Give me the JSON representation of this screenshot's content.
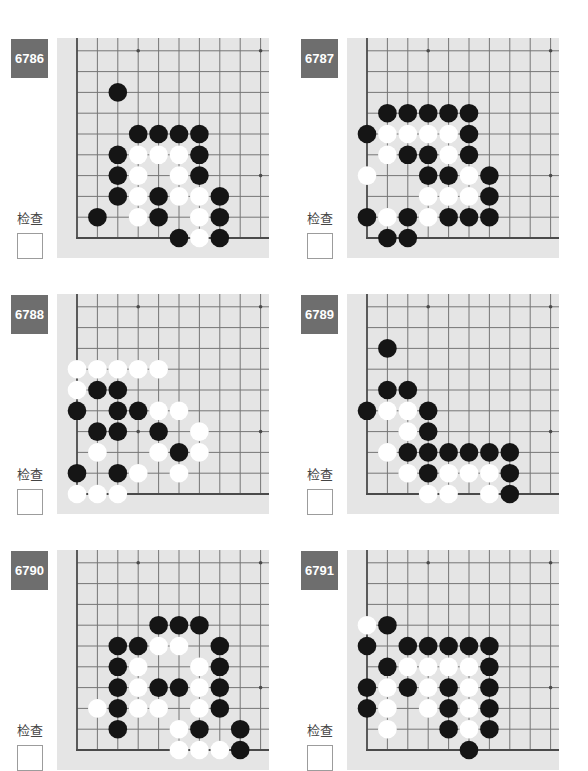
{
  "colors": {
    "page_background": "#ffffff",
    "badge_background": "#6e6e6e",
    "badge_text": "#ffffff",
    "label_text": "#444444",
    "checkbox_border": "#9c9c9c",
    "board_background": "#e5e5e5",
    "grid_line": "#767676",
    "board_edge": "#4a4a4a",
    "star_point": "#4a4a4a",
    "black_stone": "#151515",
    "white_stone": "#ffffff"
  },
  "board": {
    "visible_columns": 10,
    "visible_rows": 10,
    "visible_edges": [
      "left",
      "bottom"
    ],
    "star_points": [
      [
        3,
        3
      ],
      [
        3,
        9
      ],
      [
        9,
        3
      ],
      [
        9,
        9
      ]
    ]
  },
  "problems": [
    {
      "number": "6786",
      "check_label": "检查",
      "checked": false,
      "black": [
        [
          2,
          7
        ],
        [
          3,
          5
        ],
        [
          4,
          5
        ],
        [
          5,
          5
        ],
        [
          6,
          5
        ],
        [
          2,
          4
        ],
        [
          6,
          4
        ],
        [
          2,
          3
        ],
        [
          6,
          3
        ],
        [
          2,
          2
        ],
        [
          4,
          2
        ],
        [
          7,
          2
        ],
        [
          1,
          1
        ],
        [
          4,
          1
        ],
        [
          7,
          1
        ],
        [
          5,
          0
        ],
        [
          7,
          0
        ]
      ],
      "white": [
        [
          3,
          4
        ],
        [
          4,
          4
        ],
        [
          5,
          4
        ],
        [
          3,
          3
        ],
        [
          5,
          3
        ],
        [
          3,
          2
        ],
        [
          5,
          2
        ],
        [
          6,
          2
        ],
        [
          3,
          1
        ],
        [
          6,
          1
        ],
        [
          6,
          0
        ]
      ]
    },
    {
      "number": "6787",
      "check_label": "检查",
      "checked": false,
      "black": [
        [
          1,
          6
        ],
        [
          2,
          6
        ],
        [
          3,
          6
        ],
        [
          4,
          6
        ],
        [
          5,
          6
        ],
        [
          0,
          5
        ],
        [
          5,
          5
        ],
        [
          2,
          4
        ],
        [
          3,
          4
        ],
        [
          5,
          4
        ],
        [
          3,
          3
        ],
        [
          4,
          3
        ],
        [
          6,
          3
        ],
        [
          6,
          2
        ],
        [
          0,
          1
        ],
        [
          2,
          1
        ],
        [
          4,
          1
        ],
        [
          5,
          1
        ],
        [
          6,
          1
        ],
        [
          1,
          0
        ],
        [
          2,
          0
        ]
      ],
      "white": [
        [
          1,
          5
        ],
        [
          2,
          5
        ],
        [
          3,
          5
        ],
        [
          4,
          5
        ],
        [
          1,
          4
        ],
        [
          4,
          4
        ],
        [
          0,
          3
        ],
        [
          5,
          3
        ],
        [
          3,
          2
        ],
        [
          4,
          2
        ],
        [
          5,
          2
        ],
        [
          1,
          1
        ],
        [
          3,
          1
        ]
      ]
    },
    {
      "number": "6788",
      "check_label": "检查",
      "checked": false,
      "black": [
        [
          1,
          5
        ],
        [
          2,
          5
        ],
        [
          0,
          4
        ],
        [
          2,
          4
        ],
        [
          3,
          4
        ],
        [
          1,
          3
        ],
        [
          2,
          3
        ],
        [
          4,
          3
        ],
        [
          5,
          2
        ],
        [
          0,
          1
        ],
        [
          2,
          1
        ]
      ],
      "white": [
        [
          0,
          6
        ],
        [
          1,
          6
        ],
        [
          2,
          6
        ],
        [
          3,
          6
        ],
        [
          4,
          6
        ],
        [
          0,
          5
        ],
        [
          4,
          4
        ],
        [
          5,
          4
        ],
        [
          6,
          3
        ],
        [
          1,
          2
        ],
        [
          4,
          2
        ],
        [
          6,
          2
        ],
        [
          3,
          1
        ],
        [
          5,
          1
        ],
        [
          0,
          0
        ],
        [
          1,
          0
        ],
        [
          2,
          0
        ]
      ]
    },
    {
      "number": "6789",
      "check_label": "检查",
      "checked": false,
      "black": [
        [
          1,
          7
        ],
        [
          1,
          5
        ],
        [
          2,
          5
        ],
        [
          0,
          4
        ],
        [
          3,
          4
        ],
        [
          3,
          3
        ],
        [
          2,
          2
        ],
        [
          3,
          2
        ],
        [
          4,
          2
        ],
        [
          5,
          2
        ],
        [
          6,
          2
        ],
        [
          7,
          2
        ],
        [
          3,
          1
        ],
        [
          7,
          1
        ],
        [
          7,
          0
        ]
      ],
      "white": [
        [
          1,
          4
        ],
        [
          2,
          4
        ],
        [
          2,
          3
        ],
        [
          1,
          2
        ],
        [
          2,
          1
        ],
        [
          4,
          1
        ],
        [
          5,
          1
        ],
        [
          6,
          1
        ],
        [
          3,
          0
        ],
        [
          4,
          0
        ],
        [
          6,
          0
        ]
      ]
    },
    {
      "number": "6790",
      "check_label": "检查",
      "checked": false,
      "black": [
        [
          4,
          6
        ],
        [
          5,
          6
        ],
        [
          6,
          6
        ],
        [
          2,
          5
        ],
        [
          3,
          5
        ],
        [
          7,
          5
        ],
        [
          2,
          4
        ],
        [
          7,
          4
        ],
        [
          2,
          3
        ],
        [
          4,
          3
        ],
        [
          5,
          3
        ],
        [
          7,
          3
        ],
        [
          2,
          2
        ],
        [
          7,
          2
        ],
        [
          2,
          1
        ],
        [
          6,
          1
        ],
        [
          8,
          1
        ],
        [
          8,
          0
        ]
      ],
      "white": [
        [
          4,
          5
        ],
        [
          5,
          5
        ],
        [
          3,
          4
        ],
        [
          6,
          4
        ],
        [
          3,
          3
        ],
        [
          6,
          3
        ],
        [
          1,
          2
        ],
        [
          3,
          2
        ],
        [
          4,
          2
        ],
        [
          6,
          2
        ],
        [
          5,
          1
        ],
        [
          5,
          0
        ],
        [
          6,
          0
        ],
        [
          7,
          0
        ]
      ]
    },
    {
      "number": "6791",
      "check_label": "检查",
      "checked": false,
      "black": [
        [
          1,
          6
        ],
        [
          0,
          5
        ],
        [
          2,
          5
        ],
        [
          3,
          5
        ],
        [
          4,
          5
        ],
        [
          5,
          5
        ],
        [
          6,
          5
        ],
        [
          1,
          4
        ],
        [
          6,
          4
        ],
        [
          0,
          3
        ],
        [
          2,
          3
        ],
        [
          4,
          3
        ],
        [
          6,
          3
        ],
        [
          0,
          2
        ],
        [
          4,
          2
        ],
        [
          6,
          2
        ],
        [
          4,
          1
        ],
        [
          6,
          1
        ],
        [
          5,
          0
        ]
      ],
      "white": [
        [
          0,
          6
        ],
        [
          2,
          4
        ],
        [
          3,
          4
        ],
        [
          4,
          4
        ],
        [
          5,
          4
        ],
        [
          1,
          3
        ],
        [
          3,
          3
        ],
        [
          5,
          3
        ],
        [
          1,
          2
        ],
        [
          3,
          2
        ],
        [
          5,
          2
        ],
        [
          1,
          1
        ],
        [
          5,
          1
        ]
      ]
    }
  ]
}
